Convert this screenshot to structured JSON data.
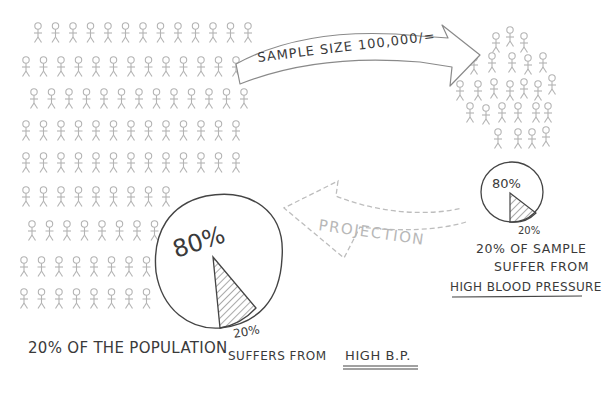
{
  "population": {
    "rows": [
      {
        "y": 32,
        "x0": 38,
        "count": 13
      },
      {
        "y": 66,
        "x0": 26,
        "count": 13
      },
      {
        "y": 98,
        "x0": 34,
        "count": 13
      },
      {
        "y": 130,
        "x0": 26,
        "count": 13
      },
      {
        "y": 162,
        "x0": 26,
        "count": 13
      },
      {
        "y": 196,
        "x0": 26,
        "count": 9
      },
      {
        "y": 230,
        "x0": 32,
        "count": 8
      },
      {
        "y": 266,
        "x0": 24,
        "count": 8
      },
      {
        "y": 298,
        "x0": 24,
        "count": 8
      }
    ],
    "spacing": 17.5,
    "color": "#b5b5b5"
  },
  "sample_arrow": {
    "label": "SAMPLE SIZE 100,000/="
  },
  "sample_group": {
    "color": "#b5b5b5"
  },
  "projection_arrow": {
    "label": "PROJECTION"
  },
  "small_pie": {
    "major_label": "80%",
    "minor_label": "20%",
    "caption_line1": "20% OF SAMPLE",
    "caption_line2": "SUFFER FROM",
    "caption_line3": "HIGH BLOOD PRESSURE"
  },
  "large_pie": {
    "major_label": "80%",
    "minor_label": "20%"
  },
  "bottom_caption": {
    "part1": "20% OF THE POPULATION",
    "part2": "SUFFERS FROM",
    "emphasis": "HIGH B.P."
  },
  "chart_data": {
    "type": "pie",
    "title": "",
    "series": [
      {
        "name": "Sample (100,000)",
        "categories": [
          "No high BP",
          "High blood pressure"
        ],
        "values": [
          80,
          20
        ]
      },
      {
        "name": "Population (projection)",
        "categories": [
          "No high BP",
          "High BP"
        ],
        "values": [
          80,
          20
        ]
      }
    ]
  }
}
